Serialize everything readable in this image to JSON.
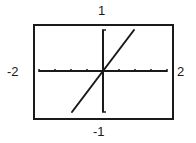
{
  "chart_data": {
    "type": "line",
    "title": "",
    "xlabel": "",
    "ylabel": "",
    "xlim": [
      -2,
      2
    ],
    "ylim": [
      -1,
      1
    ],
    "window_labels": {
      "ymax": "1",
      "ymin": "-1",
      "xmin": "-2",
      "xmax": "2"
    },
    "x_tick_step": 0.5,
    "grid": false,
    "legend": null,
    "series": [
      {
        "name": "f(x)",
        "x": [
          -0.97,
          0,
          0.97
        ],
        "y": [
          -1,
          0,
          1
        ]
      }
    ]
  },
  "colors": {
    "ink": "#1a1a1a",
    "background": "#ffffff"
  }
}
